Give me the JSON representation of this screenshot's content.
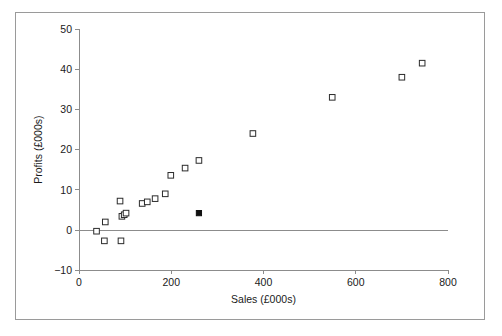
{
  "chart_data": {
    "type": "scatter",
    "title": "",
    "xlabel": "Sales (£000s)",
    "ylabel": "Profits (£000s)",
    "xlim": [
      0,
      800
    ],
    "ylim": [
      -10,
      50
    ],
    "xticks": [
      0,
      200,
      400,
      600,
      800
    ],
    "yticks": [
      -10,
      0,
      10,
      20,
      30,
      40,
      50
    ],
    "xticklabels": [
      "0",
      "200",
      "400",
      "600",
      "800"
    ],
    "yticklabels": [
      "−10",
      "0",
      "10",
      "20",
      "30",
      "40",
      "50"
    ],
    "grid": false,
    "legend": null,
    "zero_line": 0,
    "series": [
      {
        "name": "Companies",
        "marker": "open-square",
        "points": [
          {
            "x": 38,
            "y": -0.3
          },
          {
            "x": 55,
            "y": -2.7
          },
          {
            "x": 57,
            "y": 2.0
          },
          {
            "x": 89,
            "y": 7.2
          },
          {
            "x": 91,
            "y": -2.7
          },
          {
            "x": 93,
            "y": 3.4
          },
          {
            "x": 98,
            "y": 3.8
          },
          {
            "x": 102,
            "y": 4.2
          },
          {
            "x": 137,
            "y": 6.6
          },
          {
            "x": 148,
            "y": 7.0
          },
          {
            "x": 165,
            "y": 7.8
          },
          {
            "x": 187,
            "y": 9.0
          },
          {
            "x": 199,
            "y": 13.6
          },
          {
            "x": 230,
            "y": 15.4
          },
          {
            "x": 260,
            "y": 17.3
          },
          {
            "x": 377,
            "y": 24.0
          },
          {
            "x": 549,
            "y": 33.0
          },
          {
            "x": 700,
            "y": 38.0
          },
          {
            "x": 744,
            "y": 41.5
          }
        ]
      },
      {
        "name": "Highlighted company",
        "marker": "filled-square",
        "points": [
          {
            "x": 260,
            "y": 4.2
          }
        ]
      }
    ]
  },
  "figure": {
    "background_color": "#ffffff",
    "border_color": "#9a9a9a",
    "axis_color": "#8c8c8c",
    "marker_edge_color": "#2b2b2b",
    "marker_fill_color": "#ffffff",
    "highlight_color": "#101010",
    "text_color": "#1a1a1a"
  }
}
